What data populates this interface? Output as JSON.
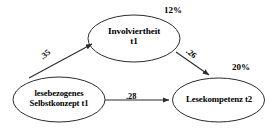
{
  "diagram": {
    "type": "path-model",
    "background_color": "#ffffff",
    "stroke_color": "#2b2b2b",
    "text_color": "#000000",
    "nodes": [
      {
        "id": "involviertheit",
        "label_line1": "Involviertheit",
        "label_line2": "t1",
        "variance_explained": "12%"
      },
      {
        "id": "selbstkonzept",
        "label_line1": "lesebezogenes",
        "label_line2": "Selbstkonzept t1",
        "variance_explained": ""
      },
      {
        "id": "lesekompetenz",
        "label_line1": "Lesekompetenz t2",
        "label_line2": "",
        "variance_explained": "20%"
      }
    ],
    "paths": [
      {
        "id": "sk-to-inv",
        "from": "selbstkonzept",
        "to": "involviertheit",
        "coefficient": ".35"
      },
      {
        "id": "inv-to-lk",
        "from": "involviertheit",
        "to": "lesekompetenz",
        "coefficient": ".26"
      },
      {
        "id": "sk-to-lk",
        "from": "selbstkonzept",
        "to": "lesekompetenz",
        "coefficient": ".28"
      }
    ]
  }
}
